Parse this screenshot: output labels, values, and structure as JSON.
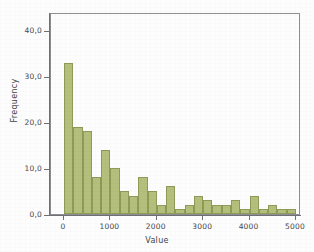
{
  "chart_data": {
    "type": "bar",
    "title": "",
    "subtitle": "",
    "xlabel": "Value",
    "ylabel": "Frequency",
    "xlim": [
      0,
      5000
    ],
    "ylim": [
      0,
      44
    ],
    "grid": false,
    "legend": "none",
    "bin_width": 200,
    "bar_color": "#b5bf7c",
    "bar_edge_color": "#8d9a58",
    "x_tick_labels": [
      "0",
      "1000",
      "2000",
      "3000",
      "4000",
      "5000"
    ],
    "x_tick_values": [
      0,
      1000,
      2000,
      3000,
      4000,
      5000
    ],
    "y_tick_labels": [
      "0,0",
      "10,0",
      "20,0",
      "30,0",
      "40,0"
    ],
    "y_tick_values": [
      0,
      10,
      20,
      30,
      40
    ],
    "categories": [
      "0-200",
      "200-400",
      "400-600",
      "600-800",
      "800-1000",
      "1000-1200",
      "1200-1400",
      "1400-1600",
      "1600-1800",
      "1800-2000",
      "2000-2200",
      "2200-2400",
      "2400-2600",
      "2600-2800",
      "2800-3000",
      "3000-3200",
      "3200-3400",
      "3400-3600",
      "3600-3800",
      "3800-4000",
      "4000-4200",
      "4200-4400",
      "4400-4600",
      "4600-4800",
      "4800-5000"
    ],
    "bin_starts": [
      0,
      200,
      400,
      600,
      800,
      1000,
      1200,
      1400,
      1600,
      1800,
      2000,
      2200,
      2400,
      2600,
      2800,
      3000,
      3200,
      3400,
      3600,
      3800,
      4000,
      4200,
      4400,
      4600,
      4800
    ],
    "values": [
      33,
      19,
      18,
      8,
      14,
      10,
      5,
      4,
      8,
      5,
      2,
      6,
      1,
      2,
      4,
      3,
      2,
      2,
      3,
      1,
      4,
      1,
      2,
      1,
      1
    ]
  }
}
